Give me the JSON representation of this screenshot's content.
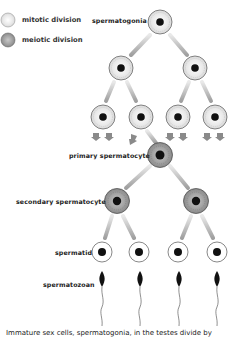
{
  "legend": {
    "items": [
      {
        "label": "mitotic division",
        "color": "#f0f0f0"
      },
      {
        "label": "meiotic division",
        "color": "#a8a8a8"
      }
    ]
  },
  "stages": {
    "spermatogonia": "spermatogonia",
    "primary_spermatocyte": "primary spermatocyte",
    "secondary_spermatocyte": "secondary spermatocyte",
    "spermatid": "spermatid",
    "spermatozoan": "spermatozoan"
  },
  "caption": "Immature sex cells, spermatogonia, in the testes divide by",
  "colors": {
    "mitotic_fill": "#f2f2f2",
    "meiotic_fill": "#a0a0a0",
    "nucleus": "#111111",
    "arrow": "#9a9a9a"
  }
}
